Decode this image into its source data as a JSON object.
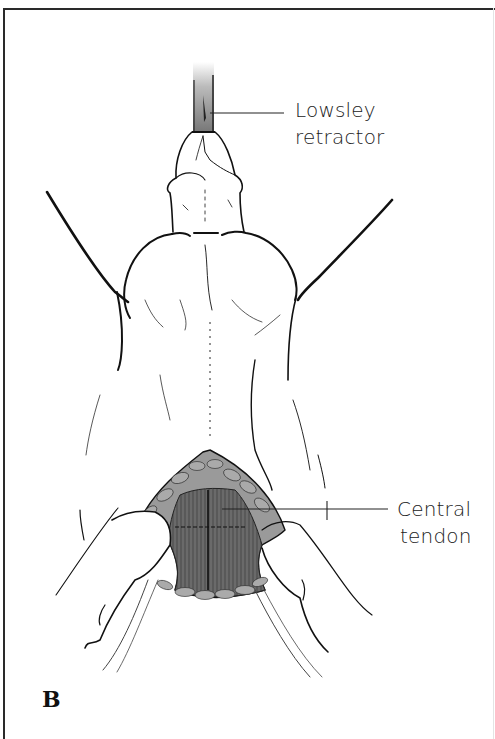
{
  "figure": {
    "panel_letter": "B",
    "labels": {
      "lowsley": {
        "line1": "Lowsley",
        "line2": "retractor"
      },
      "central": {
        "line1": "Central",
        "line2": "tendon"
      }
    },
    "colors": {
      "ink": "#111111",
      "muscle": "#6e6e6e",
      "fat": "#a8a8a8",
      "retractor": "#8a8a8a",
      "frame": "#2a2a2a"
    }
  }
}
